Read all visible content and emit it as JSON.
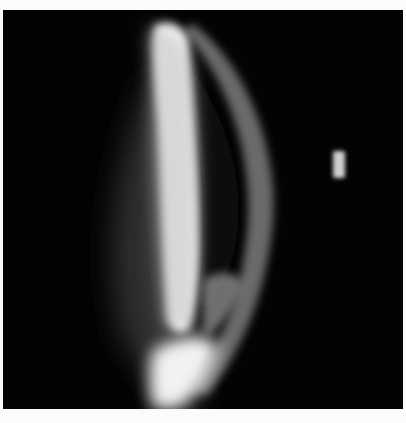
{
  "image": {
    "subject": "slit-lamp optical section of cornea",
    "background_color": "#030303",
    "border_color": "#fbfbfb",
    "elements": [
      {
        "name": "bright-corneal-band",
        "color": "#ffffff"
      },
      {
        "name": "outer-crescent-arc",
        "color": "#6a6a6a"
      },
      {
        "name": "bright-lower-lobe",
        "color": "#f2f2f2"
      },
      {
        "name": "small-reflex-marker",
        "color": "#cfcfcf"
      }
    ]
  }
}
